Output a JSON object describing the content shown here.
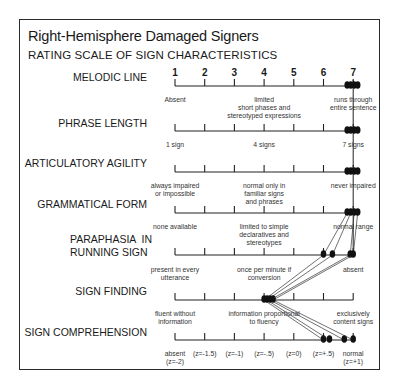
{
  "title": "Right-Hemisphere Damaged Signers",
  "subtitle": "RATING SCALE OF SIGN CHARACTERISTICS",
  "scale_numbers": [
    "1",
    "2",
    "3",
    "4",
    "5",
    "6",
    "7"
  ],
  "rows": [
    {
      "label": "MELODIC LINE",
      "descriptors": [
        {
          "text": "Absent",
          "pos": 1
        },
        {
          "text": "limited\nshort phases and\nstereotyped expressions",
          "pos": 4
        },
        {
          "text": "runs through\nentire sentence",
          "pos": 7
        }
      ]
    },
    {
      "label": "PHRASE LENGTH",
      "descriptors": [
        {
          "text": "1 sign",
          "pos": 1
        },
        {
          "text": "4 signs",
          "pos": 4
        },
        {
          "text": "7 signs",
          "pos": 7
        }
      ]
    },
    {
      "label": "ARTICULATORY AGILITY",
      "descriptors": [
        {
          "text": "always impaired\nor impossible",
          "pos": 1
        },
        {
          "text": "normal only in\nfamiliar signs\nand phrases",
          "pos": 4
        },
        {
          "text": "never impaired",
          "pos": 7
        }
      ]
    },
    {
      "label": "GRAMMATICAL FORM",
      "descriptors": [
        {
          "text": "none available",
          "pos": 1
        },
        {
          "text": "limited to simple\ndeclaratives and\nstereotypes",
          "pos": 4
        },
        {
          "text": "normal range",
          "pos": 7
        }
      ]
    },
    {
      "label": "PARAPHASIA  IN\nRUNNING SIGN",
      "descriptors": [
        {
          "text": "present in every\nutterance",
          "pos": 1
        },
        {
          "text": "once per minute if\nconversion",
          "pos": 4
        },
        {
          "text": "absent",
          "pos": 7
        }
      ]
    },
    {
      "label": "SIGN FINDING",
      "descriptors": [
        {
          "text": "fluent without\ninformation",
          "pos": 1
        },
        {
          "text": "information proportional\nto fluency",
          "pos": 4
        },
        {
          "text": "exclusively\ncontent signs",
          "pos": 7
        }
      ]
    },
    {
      "label": "SIGN COMPREHENSION",
      "descriptors": [
        {
          "text": "absent\n(z=-2)",
          "pos": 1
        },
        {
          "text": "(z=-1.5)",
          "pos": 2
        },
        {
          "text": "(z=-1)",
          "pos": 3
        },
        {
          "text": "(z=-.5)",
          "pos": 4
        },
        {
          "text": "(z=0)",
          "pos": 5
        },
        {
          "text": "(z=+.5)",
          "pos": 6
        },
        {
          "text": "normal\n(z=+1)",
          "pos": 7
        }
      ]
    }
  ],
  "chart_data": {
    "type": "scatter",
    "x_scale": [
      1,
      7
    ],
    "categories": [
      "Melodic Line",
      "Phrase Length",
      "Articulatory Agility",
      "Grammatical Form",
      "Paraphasia in Running Sign",
      "Sign Finding",
      "Sign Comprehension"
    ],
    "series": [
      {
        "name": "Signer A",
        "values": [
          7,
          7,
          7,
          7,
          6.0,
          4.0,
          6.0
        ]
      },
      {
        "name": "Signer B",
        "values": [
          7,
          7,
          7,
          7,
          6.3,
          4.1,
          6.2
        ]
      },
      {
        "name": "Signer C",
        "values": [
          7,
          7,
          7,
          7,
          6.9,
          4.2,
          6.7
        ]
      },
      {
        "name": "Signer D",
        "values": [
          7,
          7,
          7,
          7,
          7.0,
          4.3,
          7.0
        ]
      }
    ]
  }
}
